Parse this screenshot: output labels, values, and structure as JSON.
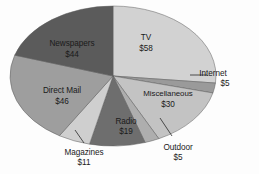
{
  "figure": {
    "title": "",
    "background_color": "#fdfdfd",
    "outline_color": "#5d5d5d"
  },
  "chart_data": {
    "type": "pie",
    "title": "",
    "subtitle": "",
    "xlabel": "",
    "ylabel": "",
    "units": "US dollars (billions)",
    "total": 218,
    "start_angle_deg": -90,
    "direction": "clockwise",
    "grid": false,
    "legend_position": "none",
    "labels_inside_slices": true,
    "categories": [
      "TV",
      "Internet",
      "Miscellaneous",
      "Outdoor",
      "Radio",
      "Magazines",
      "Direct Mail",
      "Newspapers"
    ],
    "values": [
      58,
      5,
      30,
      5,
      19,
      11,
      46,
      44
    ],
    "value_labels": [
      "$58",
      "$5",
      "$30",
      "$5",
      "$19",
      "$11",
      "$46",
      "$44"
    ],
    "slices": [
      {
        "name": "TV",
        "value": 58,
        "value_label": "$58",
        "color": "#d2d2d2",
        "label_x": 146,
        "label_y": 40,
        "label_anchor": "inside",
        "line_gap": 11
      },
      {
        "name": "Internet",
        "value": 5,
        "value_label": "$5",
        "color": "#9a9a9a",
        "label_x": 213,
        "label_y": 76,
        "label_anchor": "callout-right",
        "line_gap": 10
      },
      {
        "name": "Miscellaneous",
        "value": 30,
        "value_label": "$30",
        "color": "#c3c3c3",
        "label_x": 168,
        "label_y": 96,
        "label_anchor": "inside",
        "line_gap": 11
      },
      {
        "name": "Outdoor",
        "value": 5,
        "value_label": "$5",
        "color": "#aeaeae",
        "label_x": 178,
        "label_y": 150,
        "label_anchor": "callout-below",
        "line_gap": 10
      },
      {
        "name": "Radio",
        "value": 19,
        "value_label": "$19",
        "color": "#6e6e6e",
        "label_x": 126,
        "label_y": 124,
        "label_anchor": "inside",
        "line_gap": 10
      },
      {
        "name": "Magazines",
        "value": 11,
        "value_label": "$11",
        "color": "#cfcfcf",
        "label_x": 84,
        "label_y": 155,
        "label_anchor": "callout-below",
        "line_gap": 10
      },
      {
        "name": "Direct Mail",
        "value": 46,
        "value_label": "$46",
        "color": "#9e9e9e",
        "label_x": 62,
        "label_y": 93,
        "label_anchor": "inside",
        "line_gap": 11
      },
      {
        "name": "Newspapers",
        "value": 44,
        "value_label": "$44",
        "color": "#5b5b5b",
        "label_x": 72,
        "label_y": 46,
        "label_anchor": "inside",
        "line_gap": 11
      }
    ],
    "geometry": {
      "center_x": 113,
      "center_y": 76,
      "radius_x": 103,
      "radius_y": 70
    },
    "callouts": [
      {
        "name": "Internet",
        "from_x": 190,
        "from_y": 75,
        "to_x": 207,
        "to_y": 75
      },
      {
        "name": "Outdoor",
        "from_x": 160,
        "from_y": 118,
        "to_x": 172,
        "to_y": 136
      },
      {
        "name": "Magazines",
        "from_x": 75,
        "from_y": 130,
        "to_x": 84,
        "to_y": 143
      }
    ]
  }
}
